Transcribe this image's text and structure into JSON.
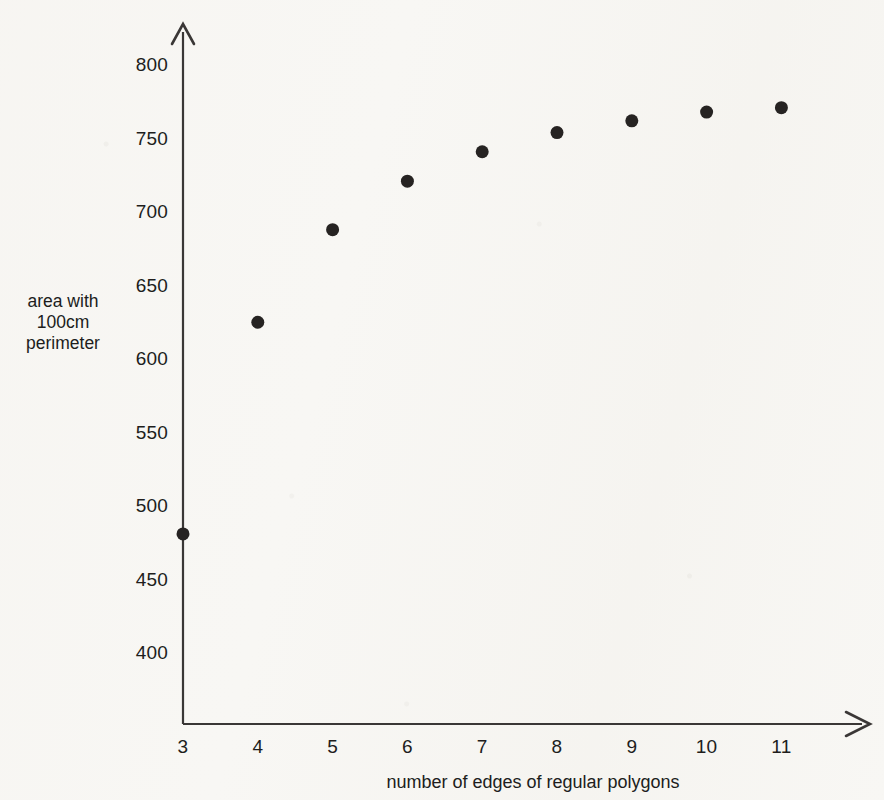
{
  "chart_data": {
    "type": "scatter",
    "title": "",
    "xlabel": "number of edges of regular polygons",
    "ylabel_lines": [
      "area with",
      "100cm",
      "perimeter"
    ],
    "ylabel": "area with 100cm perimeter",
    "x": [
      3,
      4,
      5,
      6,
      7,
      8,
      9,
      10,
      11
    ],
    "values": [
      481,
      625,
      688,
      721,
      741,
      754,
      762,
      768,
      771
    ],
    "series": [
      {
        "name": "area with 100cm perimeter",
        "points": [
          {
            "x": 3,
            "y": 481
          },
          {
            "x": 4,
            "y": 625
          },
          {
            "x": 5,
            "y": 688
          },
          {
            "x": 6,
            "y": 721
          },
          {
            "x": 7,
            "y": 741
          },
          {
            "x": 8,
            "y": 754
          },
          {
            "x": 9,
            "y": 762
          },
          {
            "x": 10,
            "y": 768
          },
          {
            "x": 11,
            "y": 771
          }
        ],
        "marker": "filled-circle",
        "marker_color": "#262322",
        "marker_size": 13
      }
    ],
    "xticks": [
      "3",
      "4",
      "5",
      "6",
      "7",
      "8",
      "9",
      "10",
      "11"
    ],
    "xtick_values": [
      3,
      4,
      5,
      6,
      7,
      8,
      9,
      10,
      11
    ],
    "yticks": [
      "400",
      "450",
      "500",
      "550",
      "600",
      "650",
      "700",
      "750",
      "800"
    ],
    "ytick_values": [
      400,
      450,
      500,
      550,
      600,
      650,
      700,
      750,
      800
    ],
    "xlim": [
      3,
      12.3
    ],
    "ylim": [
      370,
      810
    ],
    "grid": false,
    "legend": false,
    "legend_position": "none",
    "axis_style": "arrow-ended-lines",
    "axis_color": "#3a3736",
    "background_color": "#f8f7f4"
  },
  "axes": {
    "x_title": "number of edges of regular polygons",
    "y_title_line1": "area with",
    "y_title_line2": "100cm",
    "y_title_line3": "perimeter"
  }
}
